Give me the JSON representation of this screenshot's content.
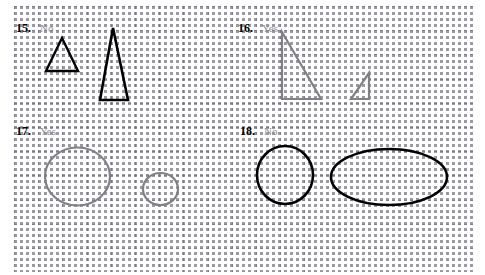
{
  "page": {
    "width": 485,
    "height": 275,
    "background_color": "#ffffff",
    "grid": {
      "style": "dotted",
      "spacing_px": 24,
      "color": "#787884"
    }
  },
  "palette": {
    "black": "#000000",
    "gray_shape": "#808088",
    "gray_text": "#8e8e96",
    "grid": "#787884"
  },
  "problems": [
    {
      "id": "15",
      "number": "15.",
      "answer": "No",
      "answer_color": "#8e8e96",
      "shape_color": "#000000",
      "shape_kind": "triangle",
      "count": 2,
      "shapes": [
        {
          "name": "small-triangle",
          "kind": "triangle",
          "points": "62,38 78,71 46,71",
          "stroke": "#000000",
          "stroke_width": 2.4
        },
        {
          "name": "tall-triangle",
          "kind": "triangle",
          "points": "113,28 128,100 100,100",
          "stroke": "#000000",
          "stroke_width": 2.6
        }
      ]
    },
    {
      "id": "16",
      "number": "16.",
      "answer": "Yes",
      "answer_color": "#8e8e96",
      "shape_color": "#808088",
      "shape_kind": "right-triangle",
      "count": 2,
      "shapes": [
        {
          "name": "large-right-triangle",
          "kind": "triangle",
          "points": "282,32 282,99 321,99",
          "stroke": "#808088",
          "stroke_width": 2.2
        },
        {
          "name": "small-right-triangle",
          "kind": "triangle",
          "points": "369,73 351,99 369,99",
          "stroke": "#808088",
          "stroke_width": 2.2
        }
      ]
    },
    {
      "id": "17",
      "number": "17.",
      "answer": "Yes",
      "answer_color": "#8e8e96",
      "shape_color": "#808088",
      "shape_kind": "circle",
      "count": 2,
      "shapes": [
        {
          "name": "large-circle",
          "kind": "ellipse",
          "cx": 77.5,
          "cy": 176.5,
          "rx": 32.5,
          "ry": 29,
          "stroke": "#808088",
          "stroke_width": 2.2
        },
        {
          "name": "small-circle",
          "kind": "ellipse",
          "cx": 160.5,
          "cy": 189,
          "rx": 17.5,
          "ry": 16,
          "stroke": "#808088",
          "stroke_width": 2.2
        }
      ]
    },
    {
      "id": "18",
      "number": "18.",
      "answer": "No",
      "answer_color": "#8e8e96",
      "shape_color": "#000000",
      "shape_kind": "circle-and-ellipse",
      "count": 2,
      "shapes": [
        {
          "name": "circle",
          "kind": "ellipse",
          "cx": 285,
          "cy": 175,
          "rx": 28,
          "ry": 29,
          "stroke": "#000000",
          "stroke_width": 2.6
        },
        {
          "name": "wide-ellipse",
          "kind": "ellipse",
          "cx": 389,
          "cy": 177,
          "rx": 58,
          "ry": 28,
          "stroke": "#000000",
          "stroke_width": 2.6
        }
      ]
    }
  ]
}
